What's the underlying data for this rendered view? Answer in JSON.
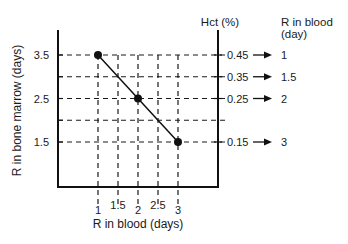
{
  "chart_data": {
    "type": "line",
    "title": "",
    "xlabel": "R in blood (days)",
    "ylabel": "R in bone marrow (days)",
    "x_ticks": [
      "1",
      "1.5",
      "2",
      "2.5",
      "3"
    ],
    "x_tick_values": [
      1,
      1.5,
      2,
      2.5,
      3
    ],
    "y_ticks": [
      "3.5",
      "2.5",
      "1.5"
    ],
    "y_tick_values": [
      3.5,
      3.0,
      2.5,
      2.0,
      1.5
    ],
    "xlim": [
      0,
      3.5
    ],
    "ylim": [
      0.4,
      4.1
    ],
    "grid": "dashed",
    "series": [
      {
        "name": "R in bone marrow vs R in blood",
        "x": [
          1,
          2,
          3
        ],
        "y": [
          3.5,
          2.5,
          1.5
        ],
        "markers": true
      }
    ],
    "right_axis": {
      "label": "Hct (%)",
      "ticks": [
        "0.45",
        "0.35",
        "0.25",
        "0.15"
      ],
      "tick_positions_y": [
        3.5,
        3.0,
        2.5,
        1.5
      ]
    },
    "annotation_column": {
      "label_line1": "R in blood",
      "label_line2": "(day)",
      "mapping": [
        {
          "hct": "0.45",
          "r_in_blood": "1"
        },
        {
          "hct": "0.35",
          "r_in_blood": "1.5"
        },
        {
          "hct": "0.25",
          "r_in_blood": "2"
        },
        {
          "hct": "0.15",
          "r_in_blood": "3"
        }
      ]
    }
  }
}
